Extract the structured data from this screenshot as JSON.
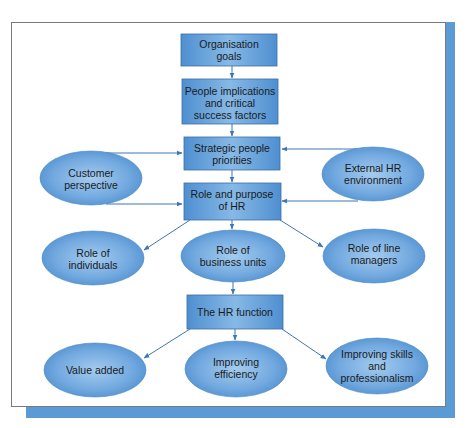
{
  "diagram": {
    "type": "flowchart",
    "colors": {
      "box_fill_edge": "#4f8fd0",
      "box_fill_center": "#86b9e6",
      "box_border": "#3a6ea8",
      "ellipse_fill_edge": "#4a8ccd",
      "ellipse_fill_center": "#a3cbee",
      "arrow": "#3f77b4",
      "frame_shadow": "#5a9bd6",
      "frame_border": "#7a7a7a"
    },
    "nodes": {
      "organisation_goals": {
        "shape": "box",
        "lines": [
          "Organisation",
          "goals"
        ]
      },
      "people_implications": {
        "shape": "box",
        "lines": [
          "People implications",
          "and critical",
          "success factors"
        ]
      },
      "strategic_priorities": {
        "shape": "box",
        "lines": [
          "Strategic people",
          "priorities"
        ]
      },
      "role_purpose_hr": {
        "shape": "box",
        "lines": [
          "Role and purpose",
          "of HR"
        ]
      },
      "customer_perspective": {
        "shape": "ellipse",
        "lines": [
          "Customer",
          "perspective"
        ]
      },
      "external_hr_environment": {
        "shape": "ellipse",
        "lines": [
          "External HR",
          "environment"
        ]
      },
      "role_individuals": {
        "shape": "ellipse",
        "lines": [
          "Role of",
          "individuals"
        ]
      },
      "role_business_units": {
        "shape": "ellipse",
        "lines": [
          "Role of",
          "business units"
        ]
      },
      "role_line_managers": {
        "shape": "ellipse",
        "lines": [
          "Role of line",
          "managers"
        ]
      },
      "hr_function": {
        "shape": "box",
        "lines": [
          "The HR function"
        ]
      },
      "value_added": {
        "shape": "ellipse",
        "lines": [
          "Value added"
        ]
      },
      "improving_efficiency": {
        "shape": "ellipse",
        "lines": [
          "Improving",
          "efficiency"
        ]
      },
      "improving_skills": {
        "shape": "ellipse",
        "lines": [
          "Improving skills",
          "and",
          "professionalism"
        ]
      }
    },
    "edges": [
      [
        "organisation_goals",
        "people_implications"
      ],
      [
        "people_implications",
        "strategic_priorities"
      ],
      [
        "strategic_priorities",
        "role_purpose_hr"
      ],
      [
        "customer_perspective",
        "strategic_priorities"
      ],
      [
        "customer_perspective",
        "role_purpose_hr"
      ],
      [
        "external_hr_environment",
        "strategic_priorities"
      ],
      [
        "external_hr_environment",
        "role_purpose_hr"
      ],
      [
        "role_purpose_hr",
        "role_individuals"
      ],
      [
        "role_purpose_hr",
        "role_business_units"
      ],
      [
        "role_purpose_hr",
        "role_line_managers"
      ],
      [
        "role_business_units",
        "hr_function"
      ],
      [
        "hr_function",
        "value_added"
      ],
      [
        "hr_function",
        "improving_efficiency"
      ],
      [
        "hr_function",
        "improving_skills"
      ]
    ]
  },
  "margin_fragments": [
    ":",
    ":",
    "l",
    ";",
    "o"
  ]
}
